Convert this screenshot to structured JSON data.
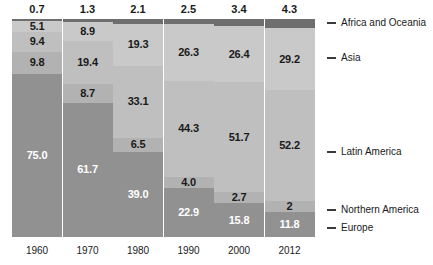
{
  "chart_data": {
    "type": "bar",
    "stacked": true,
    "stack_mode": "percent",
    "title": "",
    "subtitle": "",
    "xlabel": "",
    "ylabel": "",
    "ylim": [
      0,
      100
    ],
    "grid": false,
    "legend_position": "right",
    "categories": [
      "1960",
      "1970",
      "1980",
      "1990",
      "2000",
      "2012"
    ],
    "series": [
      {
        "name": "Africa and Oceania",
        "color": "#6e6e6e",
        "label_color": "dark",
        "values": [
          0.7,
          1.3,
          2.1,
          2.5,
          3.4,
          4.3
        ],
        "labels": [
          "0.7",
          "1.3",
          "2.1",
          "2.5",
          "3.4",
          "4.3"
        ],
        "labels_outside_top": true
      },
      {
        "name": "Asia",
        "color": "#c9c9c9",
        "label_color": "dark",
        "values": [
          5.1,
          8.9,
          19.3,
          26.3,
          26.4,
          29.2
        ],
        "labels": [
          "5.1",
          "8.9",
          "19.3",
          "26.3",
          "26.4",
          "29.2"
        ]
      },
      {
        "name": "Latin America",
        "color": "#bfbfbf",
        "label_color": "dark",
        "values": [
          9.4,
          19.4,
          33.1,
          44.3,
          51.7,
          52.2
        ],
        "labels": [
          "9.4",
          "19.4",
          "33.1",
          "44.3",
          "51.7",
          "52.2"
        ]
      },
      {
        "name": "Northern America",
        "color": "#b2b2b2",
        "label_color": "dark",
        "values": [
          9.8,
          8.7,
          6.5,
          4.0,
          2.7,
          2.0
        ],
        "labels": [
          "9.8",
          "8.7",
          "6.5",
          "4.0",
          "2.7",
          "2"
        ]
      },
      {
        "name": "Europe",
        "color": "#919191",
        "label_color": "light",
        "values": [
          75.0,
          61.7,
          39.0,
          22.9,
          15.8,
          11.8
        ],
        "labels": [
          "75.0",
          "61.7",
          "39.0",
          "22.9",
          "15.8",
          "11.8"
        ]
      }
    ]
  },
  "legend": {
    "items": [
      {
        "label": "Africa and Oceania"
      },
      {
        "label": "Asia"
      },
      {
        "label": "Latin America"
      },
      {
        "label": "Northern America"
      },
      {
        "label": "Europe"
      }
    ]
  },
  "axis": {
    "x_tick_labels": [
      "1960",
      "1970",
      "1980",
      "1990",
      "2000",
      "2012"
    ]
  },
  "colors": {
    "africa_and_oceania": "#6e6e6e",
    "asia": "#c9c9c9",
    "latin_america": "#bfbfbf",
    "northern_america": "#b2b2b2",
    "europe": "#919191",
    "background": "#ffffff",
    "text": "#1a1a1a",
    "legend_dash": "#3a3a3a"
  }
}
